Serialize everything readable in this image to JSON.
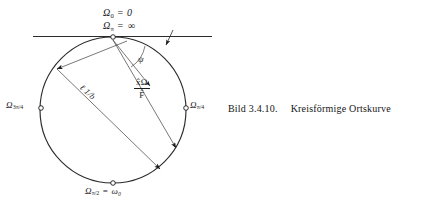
{
  "figure": {
    "caption_number": "Bild 3.4.10.",
    "caption_text": "Kreisförmige Ortskurve",
    "language": "de"
  },
  "labels": {
    "omega_zero": {
      "symbol": "Ω",
      "subscript": "0",
      "relation": "=",
      "value": "0",
      "full": "Ω₀ = 0"
    },
    "omega_pi": {
      "symbol": "Ω",
      "subscript": "π",
      "relation": "=",
      "value": "∞",
      "full": "Ω_π = ∞"
    },
    "omega_3pi4": {
      "symbol": "Ω",
      "subscript": "3π/4",
      "full": "Ω_3π/4"
    },
    "omega_pi4": {
      "symbol": "Ω",
      "subscript": "π/4",
      "full": "Ω_π/4"
    },
    "omega_pi2": {
      "symbol": "Ω",
      "subscript": "π/2",
      "relation": "=",
      "value": "ω₀",
      "full": "Ω_π/2 = ω₀"
    },
    "radius": {
      "text": "ℓ 1/b",
      "full": "e 1/b"
    },
    "vector_fraction": {
      "numerator": "x̂Ω",
      "denominator": "F̂",
      "full": "x̂Ω / F̂"
    },
    "angle": {
      "symbol": "ψ",
      "full": "ψ"
    }
  },
  "geometry": {
    "circle": {
      "cx": 113,
      "cy": 110,
      "r": 73
    },
    "tangent_line": {
      "x1": 33,
      "y1": 36.5,
      "x2": 212,
      "y2": 36.5
    },
    "top_point": {
      "x": 113,
      "y": 37
    },
    "points": [
      {
        "name": "omega-pi-point",
        "x": 113,
        "y": 37
      },
      {
        "name": "omega-3pi4-point",
        "x": 41,
        "y": 108
      },
      {
        "name": "omega-pi4-point",
        "x": 186,
        "y": 108
      },
      {
        "name": "omega-pi2-point",
        "x": 113,
        "y": 183
      }
    ]
  },
  "style": {
    "ink": "#1b1b1b",
    "line": "#3a3a3a",
    "background": "#ffffff"
  }
}
